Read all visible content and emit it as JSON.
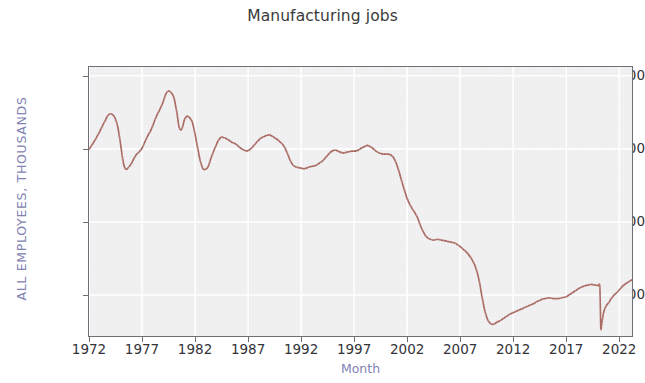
{
  "chart_data": {
    "type": "line",
    "title": "Manufacturing jobs",
    "xlabel": "Month",
    "ylabel": "ALL EMPLOYEES, THOUSANDS",
    "series_name": "All employees, manufacturing",
    "line_color": "#a05a50",
    "plot_background": "#eeeef0",
    "grid": true,
    "grid_color": "#ffffff",
    "legend": null,
    "xlim": [
      1972.0,
      2023.2
    ],
    "ylim": [
      11100,
      20300
    ],
    "xtick_labels": [
      "1972",
      "1977",
      "1982",
      "1987",
      "1992",
      "1997",
      "2002",
      "2007",
      "2012",
      "2017",
      "2022"
    ],
    "xtick_values": [
      1972,
      1977,
      1982,
      1987,
      1992,
      1997,
      2002,
      2007,
      2012,
      2017,
      2022
    ],
    "ytick_labels": [
      "20,000",
      "17,500",
      "15,000",
      "12,500"
    ],
    "ytick_values": [
      20000,
      17500,
      15000,
      12500
    ],
    "x": [
      1972.0,
      1972.25,
      1972.5,
      1972.75,
      1973.0,
      1973.25,
      1973.5,
      1973.75,
      1974.0,
      1974.25,
      1974.5,
      1974.75,
      1975.0,
      1975.25,
      1975.5,
      1975.75,
      1976.0,
      1976.25,
      1976.5,
      1976.75,
      1977.0,
      1977.25,
      1977.5,
      1977.75,
      1978.0,
      1978.25,
      1978.5,
      1978.75,
      1979.0,
      1979.25,
      1979.5,
      1979.75,
      1980.0,
      1980.25,
      1980.5,
      1980.75,
      1981.0,
      1981.25,
      1981.5,
      1981.75,
      1982.0,
      1982.25,
      1982.5,
      1982.75,
      1983.0,
      1983.25,
      1983.5,
      1983.75,
      1984.0,
      1984.25,
      1984.5,
      1984.75,
      1985.0,
      1985.25,
      1985.5,
      1985.75,
      1986.0,
      1986.25,
      1986.5,
      1986.75,
      1987.0,
      1987.25,
      1987.5,
      1987.75,
      1988.0,
      1988.25,
      1988.5,
      1988.75,
      1989.0,
      1989.25,
      1989.5,
      1989.75,
      1990.0,
      1990.25,
      1990.5,
      1990.75,
      1991.0,
      1991.25,
      1991.5,
      1991.75,
      1992.0,
      1992.25,
      1992.5,
      1992.75,
      1993.0,
      1993.25,
      1993.5,
      1993.75,
      1994.0,
      1994.25,
      1994.5,
      1994.75,
      1995.0,
      1995.25,
      1995.5,
      1995.75,
      1996.0,
      1996.25,
      1996.5,
      1996.75,
      1997.0,
      1997.25,
      1997.5,
      1997.75,
      1998.0,
      1998.25,
      1998.5,
      1998.75,
      1999.0,
      1999.25,
      1999.5,
      1999.75,
      2000.0,
      2000.25,
      2000.5,
      2000.75,
      2001.0,
      2001.25,
      2001.5,
      2001.75,
      2002.0,
      2002.25,
      2002.5,
      2002.75,
      2003.0,
      2003.25,
      2003.5,
      2003.75,
      2004.0,
      2004.25,
      2004.5,
      2004.75,
      2005.0,
      2005.25,
      2005.5,
      2005.75,
      2006.0,
      2006.25,
      2006.5,
      2006.75,
      2007.0,
      2007.25,
      2007.5,
      2007.75,
      2008.0,
      2008.25,
      2008.5,
      2008.75,
      2009.0,
      2009.25,
      2009.5,
      2009.75,
      2010.0,
      2010.25,
      2010.5,
      2010.75,
      2011.0,
      2011.25,
      2011.5,
      2011.75,
      2012.0,
      2012.25,
      2012.5,
      2012.75,
      2013.0,
      2013.25,
      2013.5,
      2013.75,
      2014.0,
      2014.25,
      2014.5,
      2014.75,
      2015.0,
      2015.25,
      2015.5,
      2015.75,
      2016.0,
      2016.25,
      2016.5,
      2016.75,
      2017.0,
      2017.25,
      2017.5,
      2017.75,
      2018.0,
      2018.25,
      2018.5,
      2018.75,
      2019.0,
      2019.25,
      2019.5,
      2019.75,
      2020.0,
      2020.17,
      2020.25,
      2020.33,
      2020.5,
      2020.75,
      2021.0,
      2021.25,
      2021.5,
      2021.75,
      2022.0,
      2022.25,
      2022.5,
      2022.75,
      2023.0,
      2023.17
    ],
    "y": [
      17480,
      17620,
      17760,
      17920,
      18080,
      18280,
      18450,
      18620,
      18700,
      18660,
      18520,
      18180,
      17600,
      17000,
      16800,
      16880,
      17000,
      17180,
      17320,
      17400,
      17520,
      17720,
      17920,
      18080,
      18280,
      18520,
      18720,
      18900,
      19120,
      19380,
      19480,
      19420,
      19260,
      18820,
      18240,
      18180,
      18500,
      18620,
      18560,
      18400,
      18000,
      17520,
      17080,
      16820,
      16800,
      16900,
      17180,
      17420,
      17640,
      17820,
      17900,
      17880,
      17840,
      17780,
      17720,
      17680,
      17620,
      17540,
      17480,
      17440,
      17440,
      17500,
      17600,
      17700,
      17800,
      17880,
      17920,
      17960,
      17980,
      17940,
      17880,
      17820,
      17740,
      17660,
      17520,
      17300,
      17080,
      16940,
      16880,
      16860,
      16840,
      16820,
      16840,
      16880,
      16900,
      16920,
      16960,
      17020,
      17080,
      17180,
      17280,
      17380,
      17440,
      17460,
      17420,
      17380,
      17360,
      17380,
      17400,
      17420,
      17420,
      17440,
      17480,
      17540,
      17580,
      17620,
      17580,
      17520,
      17440,
      17380,
      17340,
      17320,
      17320,
      17320,
      17280,
      17180,
      16980,
      16700,
      16380,
      16080,
      15800,
      15600,
      15440,
      15300,
      15120,
      14880,
      14680,
      14520,
      14440,
      14400,
      14380,
      14400,
      14400,
      14380,
      14360,
      14340,
      14320,
      14300,
      14280,
      14220,
      14160,
      14080,
      14000,
      13900,
      13780,
      13620,
      13400,
      13060,
      12560,
      12080,
      11740,
      11560,
      11500,
      11520,
      11580,
      11620,
      11680,
      11740,
      11800,
      11860,
      11900,
      11940,
      11980,
      12020,
      12060,
      12100,
      12140,
      12180,
      12220,
      12280,
      12320,
      12360,
      12380,
      12400,
      12400,
      12380,
      12380,
      12380,
      12400,
      12420,
      12440,
      12500,
      12560,
      12620,
      12680,
      12740,
      12780,
      12820,
      12840,
      12860,
      12860,
      12840,
      12820,
      12760,
      11420,
      11460,
      11880,
      12120,
      12240,
      12380,
      12500,
      12580,
      12680,
      12780,
      12860,
      12920,
      12980,
      13020
    ]
  }
}
